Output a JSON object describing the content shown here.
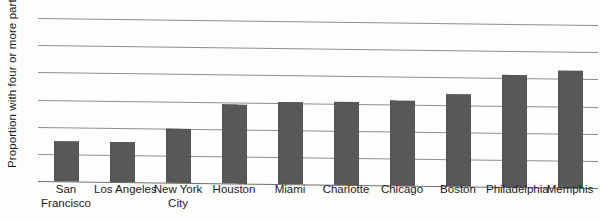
{
  "chart_data": {
    "type": "bar",
    "title": "",
    "xlabel": "",
    "ylabel": "Proportion with four or more partners",
    "ylim": [
      0,
      30
    ],
    "yticks": [
      0,
      5,
      10,
      15,
      20,
      25,
      30
    ],
    "ytick_labels": [
      "0",
      "5",
      "10",
      "15",
      "20",
      "25",
      "30"
    ],
    "grid": true,
    "legend": false,
    "bar_color": "#585857",
    "gridline_color": "#8e8e8e",
    "categories": [
      "San Francisco",
      "Los Angeles",
      "New York City",
      "Houston",
      "Miami",
      "Charlotte",
      "Chicago",
      "Boston",
      "Philadelphia",
      "Memphis"
    ],
    "category_lines": [
      [
        "San",
        "Francisco"
      ],
      [
        "Los Angeles",
        ""
      ],
      [
        "New York",
        "City"
      ],
      [
        "Houston",
        ""
      ],
      [
        "Miami",
        ""
      ],
      [
        "Charlotte",
        ""
      ],
      [
        "Chicago",
        ""
      ],
      [
        "Boston",
        ""
      ],
      [
        "Philadelphia",
        ""
      ],
      [
        "Memphis",
        ""
      ]
    ],
    "values": [
      7.3,
      7.4,
      10.0,
      14.6,
      15.1,
      15.3,
      15.6,
      17.0,
      20.6,
      21.5
    ]
  }
}
